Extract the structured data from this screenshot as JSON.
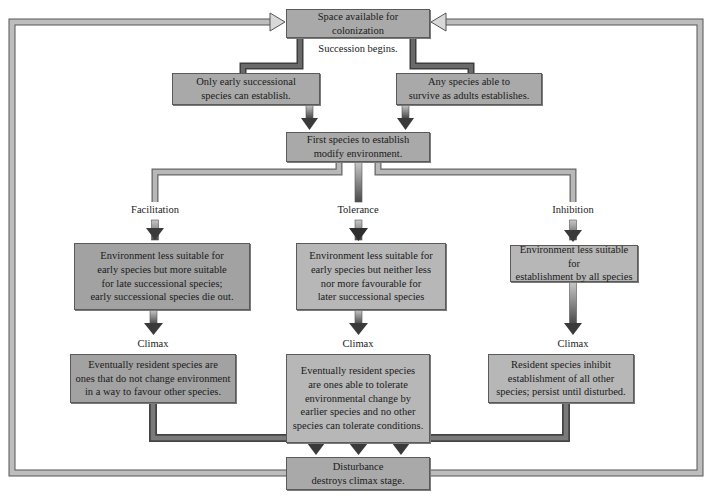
{
  "diagram": {
    "title_box": "Space available for colonization",
    "start_label": "Succession begins.",
    "early_path_box": "Only early successional\nspecies can establish.",
    "any_species_box": "Any species able to\nsurvive as adults establishes.",
    "modify_box": "First species to establish\nmodify environment.",
    "branches": [
      {
        "name": "Facilitation",
        "effect": "Environment less suitable for\nearly species but more suitable\nfor late successional species;\nearly successional species die out.",
        "climax_label": "Climax",
        "climax": "Eventually resident species are\nones that do not change environment\nin a way to favour other species."
      },
      {
        "name": "Tolerance",
        "effect": "Environment less suitable for\nearly species but neither less\nnor more favourable for\nlater successional species",
        "climax_label": "Climax",
        "climax": "Eventually resident species\nare ones able to tolerate\nenvironmental change by\nearlier species and no other\nspecies can tolerate conditions."
      },
      {
        "name": "Inhibition",
        "effect": "Environment less suitable for\nestablishment by all species",
        "climax_label": "Climax",
        "climax": "Resident species inhibit\nestablishment of all other\nspecies; persist until disturbed."
      }
    ],
    "disturbance_box": "Disturbance\ndestroys climax stage.",
    "colors": {
      "box_fill": "#a9a9a9",
      "box_fill_light": "#b7b7b7",
      "box_border": "#5a5a5a",
      "arrow_light": "#c4c4c4",
      "arrow_dark": "#4a4a4a",
      "loop_fill": "#b5b5b5"
    }
  }
}
